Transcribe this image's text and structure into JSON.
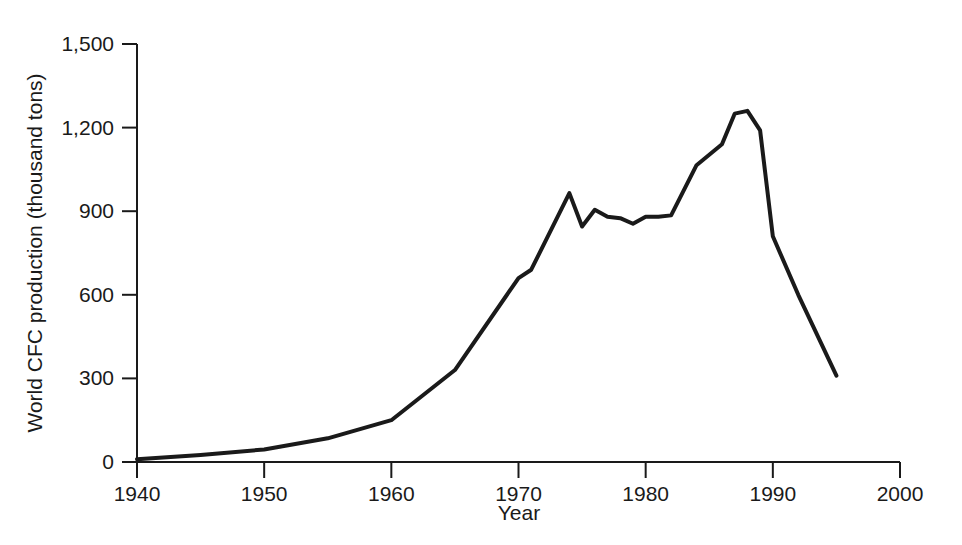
{
  "chart_data": {
    "type": "line",
    "title": "",
    "subtitle": "",
    "xlabel": "Year",
    "ylabel": "World CFC production (thousand tons)",
    "xlim": [
      1940,
      2000
    ],
    "ylim": [
      0,
      1500
    ],
    "xticks": [
      1940,
      1950,
      1960,
      1970,
      1980,
      1990,
      2000
    ],
    "xtick_labels": [
      "1940",
      "1950",
      "1960",
      "1970",
      "1980",
      "1990",
      "2000"
    ],
    "yticks": [
      0,
      300,
      600,
      900,
      1200,
      1500
    ],
    "ytick_labels": [
      "0",
      "300",
      "600",
      "900",
      "1,200",
      "1,500"
    ],
    "grid": false,
    "legend": null,
    "series": [
      {
        "name": "World CFC production",
        "color": "#1a1a1a",
        "line_width": 4,
        "x": [
          1940,
          1945,
          1950,
          1955,
          1960,
          1965,
          1970,
          1971,
          1974,
          1975,
          1976,
          1977,
          1978,
          1979,
          1980,
          1981,
          1982,
          1984,
          1986,
          1987,
          1988,
          1989,
          1990,
          1992,
          1995
        ],
        "y": [
          10,
          25,
          45,
          85,
          150,
          330,
          660,
          690,
          965,
          845,
          905,
          880,
          875,
          855,
          880,
          880,
          885,
          1065,
          1140,
          1250,
          1260,
          1190,
          810,
          600,
          310
        ]
      }
    ]
  },
  "axes": {
    "y_axis_label": "World CFC production (thousand tons)",
    "x_axis_label": "Year"
  }
}
